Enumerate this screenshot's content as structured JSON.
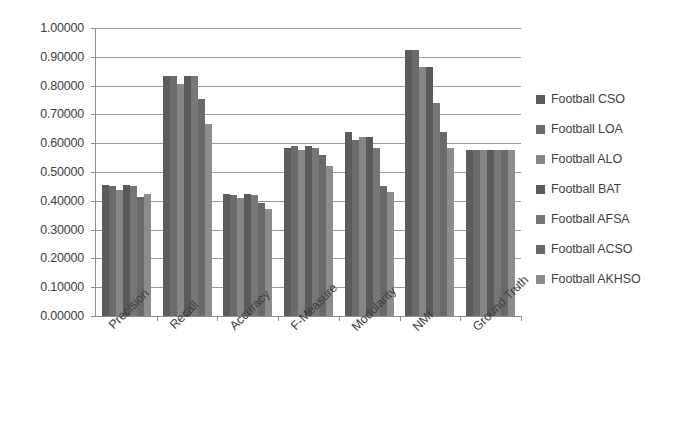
{
  "chart_data": {
    "type": "bar",
    "title": "",
    "subtitle": "",
    "xlabel": "",
    "ylabel": "",
    "ylim": [
      0,
      1.0
    ],
    "ytick_step": 0.1,
    "grid": true,
    "legend_position": "right",
    "categories": [
      "Precision",
      "Recall",
      "Accuracy",
      "F-Measure",
      "Modularity",
      "NMI",
      "Ground Truth"
    ],
    "ytick_labels": [
      "1.00000",
      "0.90000",
      "0.80000",
      "0.70000",
      "0.60000",
      "0.50000",
      "0.40000",
      "0.30000",
      "0.20000",
      "0.10000",
      "0.00000"
    ],
    "ytick_values": [
      1.0,
      0.9,
      0.8,
      0.7,
      0.6,
      0.5,
      0.4,
      0.3,
      0.2,
      0.1,
      0.0
    ],
    "series": [
      {
        "name": "Football CSO",
        "color": "#5c5c5c",
        "values": [
          0.455,
          0.835,
          0.425,
          0.585,
          0.64,
          0.925,
          0.575
        ]
      },
      {
        "name": "Football LOA",
        "color": "#6b6b6b",
        "values": [
          0.45,
          0.835,
          0.42,
          0.59,
          0.61,
          0.925,
          0.575
        ]
      },
      {
        "name": "Football ALO",
        "color": "#868686",
        "values": [
          0.437,
          0.805,
          0.41,
          0.575,
          0.62,
          0.865,
          0.575
        ]
      },
      {
        "name": "Football BAT",
        "color": "#5a5a5a",
        "values": [
          0.455,
          0.835,
          0.425,
          0.59,
          0.622,
          0.865,
          0.575
        ]
      },
      {
        "name": "Football AFSA",
        "color": "#777777",
        "values": [
          0.45,
          0.835,
          0.42,
          0.585,
          0.585,
          0.74,
          0.575
        ]
      },
      {
        "name": "Football ACSO",
        "color": "#696969",
        "values": [
          0.412,
          0.755,
          0.392,
          0.56,
          0.45,
          0.64,
          0.575
        ]
      },
      {
        "name": "Football AKHSO",
        "color": "#8c8c8c",
        "values": [
          0.425,
          0.665,
          0.37,
          0.522,
          0.43,
          0.585,
          0.575
        ]
      }
    ]
  },
  "legend": {
    "items": [
      {
        "label": "Football CSO"
      },
      {
        "label": "Football LOA"
      },
      {
        "label": "Football ALO"
      },
      {
        "label": "Football BAT"
      },
      {
        "label": "Football AFSA"
      },
      {
        "label": "Football ACSO"
      },
      {
        "label": "Football AKHSO"
      }
    ]
  },
  "colors": {
    "axis": "#8e8e8e",
    "gridline": "#9a9a9a",
    "text": "#404040",
    "background": "#ffffff"
  }
}
